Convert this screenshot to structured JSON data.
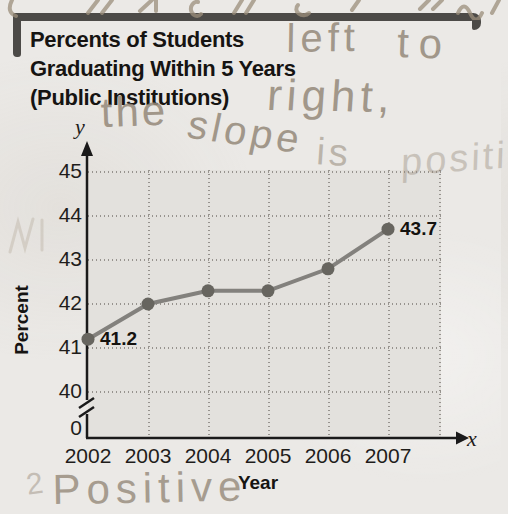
{
  "colors": {
    "page_bg": "#ebe9e6",
    "plot_bg": "#e3e1dd",
    "axis": "#1a1a1a",
    "grid": "#97938e",
    "line": "#83817d",
    "dot": "#67655f",
    "title_text": "#161412",
    "bracket": "#4c4a47",
    "ink": "#95897a"
  },
  "title": {
    "line1": "Percents of Students",
    "line2": "Graduating Within 5 Years",
    "line3": "(Public Institutions)"
  },
  "axes": {
    "y_symbol": "y",
    "x_symbol": "x",
    "origin_label": "0",
    "y_axis_title": "Percent",
    "x_axis_title": "Year"
  },
  "chart_data": {
    "type": "line",
    "title": "Percents of Students Graduating Within 5 Years (Public Institutions)",
    "xlabel": "Year",
    "ylabel": "Percent",
    "x": [
      2002,
      2003,
      2004,
      2005,
      2006,
      2007
    ],
    "values": [
      41.2,
      42.0,
      42.3,
      42.3,
      42.8,
      43.7
    ],
    "point_labels": {
      "2002": "41.2",
      "2007": "43.7"
    },
    "y_ticks": [
      45,
      44,
      43,
      42,
      41,
      40
    ],
    "ylim": [
      40,
      45
    ],
    "axis_break_between": [
      0,
      40
    ],
    "grid": "dotted",
    "legend": "none"
  },
  "annotations": {
    "handwriting": {
      "left": "left",
      "to": "to",
      "right": "right,",
      "the": "the",
      "slope": "slope",
      "is": "is",
      "positive_cutoff": "positi",
      "positive_bottom": "Positive",
      "stray_digit": "2"
    }
  }
}
